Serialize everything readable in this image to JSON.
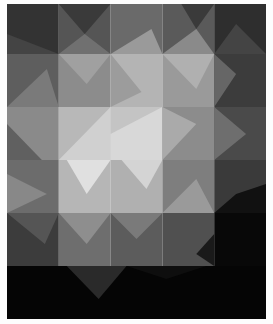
{
  "image": {
    "subject": "grayscale geometric quilt with triangular patches forming a light diagonal band across the center",
    "background": "#fdfdfd",
    "grid": {
      "columns": 5,
      "rows": 6
    },
    "palette": {
      "black": "#050505",
      "darkest": "#2a2a2a",
      "dark": "#4a4a4a",
      "mid_dark": "#6a6a6a",
      "mid": "#8a8a8a",
      "mid_light": "#a8a8a8",
      "light": "#c6c6c6",
      "lightest": "#e4e4e4"
    }
  }
}
